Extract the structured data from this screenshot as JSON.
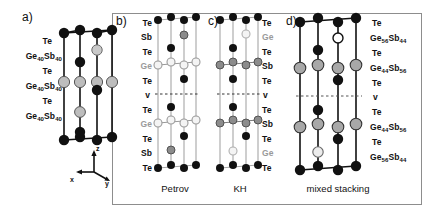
{
  "figure": {
    "kind": "crystal-structure-stacking-diagram",
    "background": "#ffffff",
    "box_border_color": "#8d8d8d"
  },
  "atom_legend": {
    "te": {
      "name": "Te",
      "fill": "#111111",
      "role": "tellurium"
    },
    "sb": {
      "name": "Sb",
      "fill": "#8c8c8c",
      "role": "antimony"
    },
    "ge": {
      "name": "Ge",
      "fill": "#f2f2f2",
      "role": "germanium"
    },
    "mixed_light": {
      "name": "GeSb-mixed",
      "fill": "#b3b3b3",
      "role": "mixed Ge/Sb site"
    }
  },
  "panels": [
    {
      "id": "a",
      "letter": "a)",
      "caption": "",
      "label_side": "left",
      "labels": [
        {
          "text": "Te",
          "color": "black"
        },
        {
          "text": "Ge40Sb40",
          "base1": "Ge",
          "sub1": "40",
          "base2": "Sb",
          "sub2": "40",
          "color": "black"
        },
        {
          "text": "Te",
          "color": "black"
        },
        {
          "text": "Ge40Sb40",
          "base1": "Ge",
          "sub1": "40",
          "base2": "Sb",
          "sub2": "40",
          "color": "black"
        },
        {
          "text": "Te",
          "color": "black"
        },
        {
          "text": "Ge40Sb40",
          "base1": "Ge",
          "sub1": "40",
          "base2": "Sb",
          "sub2": "40",
          "color": "black"
        }
      ]
    },
    {
      "id": "b",
      "letter": "b)",
      "caption": "Petrov",
      "label_side": "left",
      "labels": [
        {
          "text": "Te",
          "color": "black"
        },
        {
          "text": "Sb",
          "color": "black"
        },
        {
          "text": "Te",
          "color": "black"
        },
        {
          "text": "Ge",
          "color": "gray"
        },
        {
          "text": "Te",
          "color": "black"
        },
        {
          "text": "v",
          "color": "black"
        },
        {
          "text": "Te",
          "color": "black"
        },
        {
          "text": "Ge",
          "color": "gray"
        },
        {
          "text": "Te",
          "color": "black"
        },
        {
          "text": "Sb",
          "color": "black"
        },
        {
          "text": "Te",
          "color": "black"
        }
      ]
    },
    {
      "id": "c",
      "letter": "c)",
      "caption": "KH",
      "label_side": "right",
      "labels": [
        {
          "text": "Te",
          "color": "black"
        },
        {
          "text": "Ge",
          "color": "gray"
        },
        {
          "text": "Te",
          "color": "black"
        },
        {
          "text": "Sb",
          "color": "black"
        },
        {
          "text": "Te",
          "color": "black"
        },
        {
          "text": "v",
          "color": "black"
        },
        {
          "text": "Te",
          "color": "black"
        },
        {
          "text": "Sb",
          "color": "black"
        },
        {
          "text": "Te",
          "color": "black"
        },
        {
          "text": "Ge",
          "color": "gray"
        },
        {
          "text": "Te",
          "color": "black"
        }
      ]
    },
    {
      "id": "d",
      "letter": "d)",
      "caption": "mixed stacking",
      "label_side": "right",
      "labels": [
        {
          "text": "Te",
          "color": "black"
        },
        {
          "text": "Ge56Sb44",
          "base1": "Ge",
          "sub1": "56",
          "base2": "Sb",
          "sub2": "44",
          "color": "black"
        },
        {
          "text": "Te",
          "color": "black"
        },
        {
          "text": "Ge44Sb56",
          "base1": "Ge",
          "sub1": "44",
          "base2": "Sb",
          "sub2": "56",
          "color": "black"
        },
        {
          "text": "Te",
          "color": "black"
        },
        {
          "text": "v",
          "color": "black"
        },
        {
          "text": "Te",
          "color": "black"
        },
        {
          "text": "Ge44Sb56",
          "base1": "Ge",
          "sub1": "44",
          "base2": "Sb",
          "sub2": "56",
          "color": "black"
        },
        {
          "text": "Te",
          "color": "black"
        },
        {
          "text": "Ge56Sb44",
          "base1": "Ge",
          "sub1": "56",
          "base2": "Sb",
          "sub2": "44",
          "color": "black"
        }
      ]
    }
  ],
  "axes": {
    "z": "z",
    "x": "x",
    "y": "y"
  }
}
